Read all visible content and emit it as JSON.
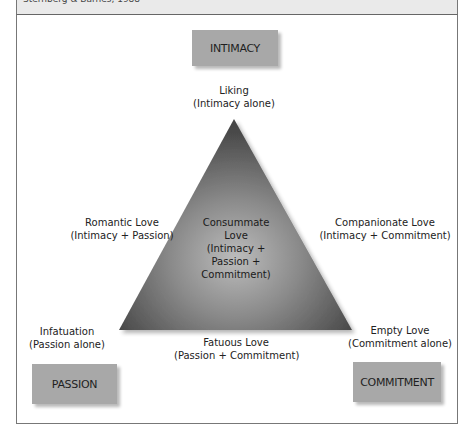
{
  "header": {
    "caption": "Sternberg & Barnes, 1988"
  },
  "components": {
    "intimacy": "INTIMACY",
    "passion": "PASSION",
    "commitment": "COMMITMENT"
  },
  "love_types": {
    "liking": {
      "name": "Liking",
      "formula": "(Intimacy alone)"
    },
    "romantic": {
      "name": "Romantic Love",
      "formula": "(Intimacy + Passion)"
    },
    "companionate": {
      "name": "Companionate Love",
      "formula": "(Intimacy + Commitment)"
    },
    "infatuation": {
      "name": "Infatuation",
      "formula": "(Passion alone)"
    },
    "empty": {
      "name": "Empty Love",
      "formula": "(Commitment alone)"
    },
    "fatuous": {
      "name": "Fatuous Love",
      "formula": "(Passion + Commitment)"
    },
    "consummate": {
      "line1": "Consummate",
      "line2": "Love",
      "line3": "(Intimacy +",
      "line4": "Passion +",
      "line5": "Commitment)"
    }
  },
  "colors": {
    "box_fill": "#a8a8a8",
    "triangle_dark": "#4a4a4a",
    "triangle_light": "#b5b5b5"
  }
}
